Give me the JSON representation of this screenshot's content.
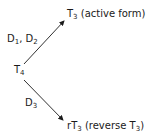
{
  "diagram": {
    "source": {
      "base": "T",
      "sub": "4"
    },
    "branches": [
      {
        "enzyme": [
          {
            "base": "D",
            "sub": "1"
          },
          {
            "sep": ", "
          },
          {
            "base": "D",
            "sub": "2"
          }
        ],
        "product": {
          "prefix": "",
          "base": "T",
          "sub": "3",
          "suffix": " (active form)"
        }
      },
      {
        "enzyme": [
          {
            "base": "D",
            "sub": "3"
          }
        ],
        "product": {
          "prefix": "r",
          "base": "T",
          "sub": "3",
          "suffix_pre": " (reverse T",
          "suffix_sub": "3",
          "suffix_post": ")"
        }
      }
    ],
    "colors": {
      "line": "#1a1a1a",
      "text": "#1a1a1a"
    }
  }
}
